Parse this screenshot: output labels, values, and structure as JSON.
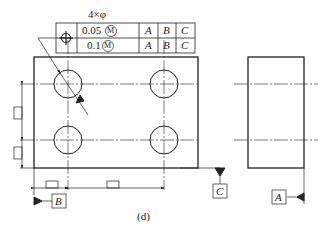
{
  "drawing": {
    "caption": "(d)",
    "feature_count_label": "4×φ",
    "fcf": {
      "symbol": "position-icon",
      "rows": [
        {
          "tolerance": "0.05",
          "modifier": "M",
          "datums": [
            "A",
            "B",
            "C"
          ]
        },
        {
          "tolerance": "0.1",
          "modifier": "M",
          "datums": [
            "A",
            "B",
            "C"
          ]
        }
      ]
    },
    "datums": {
      "A": "A",
      "B": "B",
      "C": "C"
    }
  }
}
